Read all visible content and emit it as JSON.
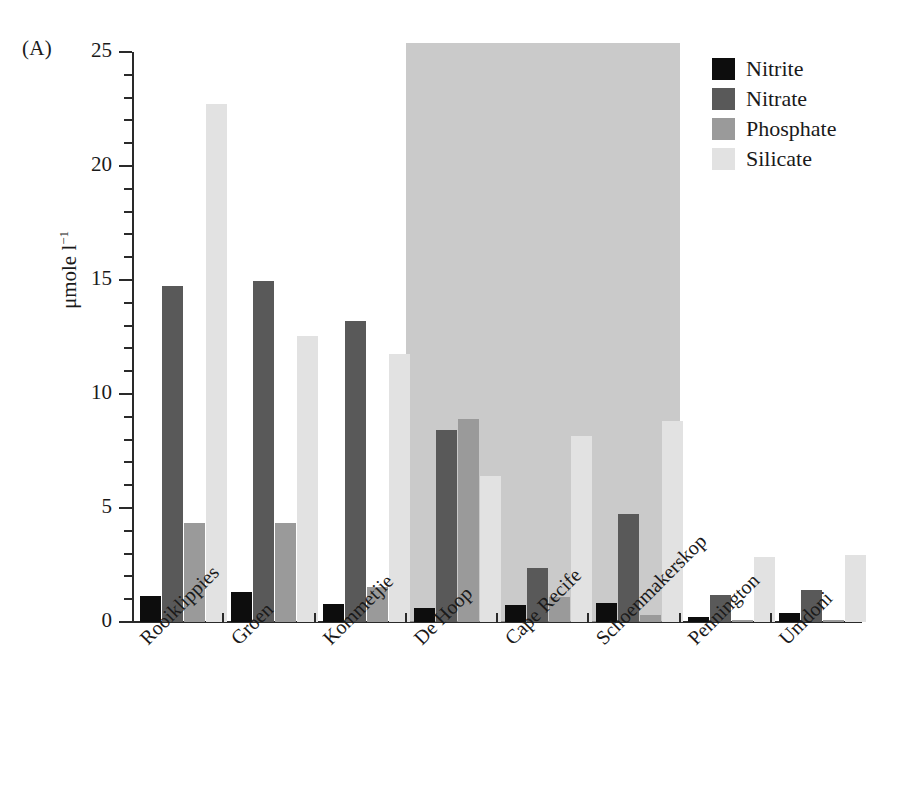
{
  "panel": {
    "label": "(A)"
  },
  "axes": {
    "ylabel_text": "μmole l",
    "ylabel_exponent": "−1",
    "y_ticks": [
      "0",
      "5",
      "10",
      "15",
      "20",
      "25"
    ],
    "y_min": 0,
    "y_max": 25,
    "y_major_step": 5,
    "y_minor_step": 1
  },
  "legend": {
    "position": "top-right",
    "items": [
      {
        "label": "Nitrite",
        "color": "#0d0d0d"
      },
      {
        "label": "Nitrate",
        "color": "#595959"
      },
      {
        "label": "Phosphate",
        "color": "#9a9a9a"
      },
      {
        "label": "Silicate",
        "color": "#e2e2e2"
      }
    ]
  },
  "shaded_region": {
    "from_category": "De Hoop",
    "to_category": "Schoenmakerskop",
    "top_value": 25.4,
    "color": "#b6b6b6"
  },
  "chart_data": {
    "type": "bar",
    "title": "",
    "xlabel": "",
    "ylabel": "μmole l⁻¹",
    "ylim": [
      0,
      25
    ],
    "grid": false,
    "legend_position": "top-right",
    "categories": [
      "Rooiklippies",
      "Groen",
      "Kommetjie",
      "De Hoop",
      "Cape Recife",
      "Schoenmakerskop",
      "Pennington",
      "Umdoni"
    ],
    "series": [
      {
        "name": "Nitrite",
        "color": "#0d0d0d",
        "values": [
          1.15,
          1.3,
          0.8,
          0.6,
          0.75,
          0.85,
          0.2,
          0.4
        ]
      },
      {
        "name": "Nitrate",
        "color": "#595959",
        "values": [
          14.75,
          14.95,
          13.2,
          8.4,
          2.35,
          4.75,
          1.2,
          1.4
        ]
      },
      {
        "name": "Phosphate",
        "color": "#9a9a9a",
        "values": [
          4.35,
          4.35,
          1.55,
          8.9,
          1.1,
          0.3,
          0.1,
          0.1
        ]
      },
      {
        "name": "Silicate",
        "color": "#e2e2e2",
        "values": [
          22.7,
          12.55,
          11.75,
          6.4,
          8.15,
          8.8,
          2.85,
          2.95
        ]
      }
    ]
  }
}
